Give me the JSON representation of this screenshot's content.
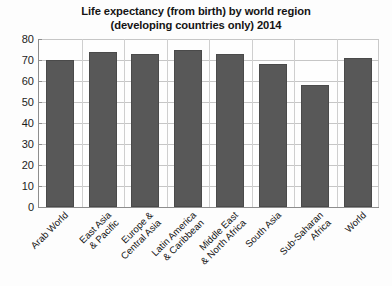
{
  "chart_data": {
    "type": "bar",
    "title": "Life expectancy (from birth) by world region\n(developing countries only) 2014",
    "title_line1": "Life expectancy (from birth) by world region",
    "title_line2": "(developing countries only) 2014",
    "xlabel": "",
    "ylabel": "",
    "ylim": [
      0,
      80
    ],
    "ytick_step": 10,
    "yticks": [
      80,
      70,
      60,
      50,
      40,
      30,
      20,
      10,
      0
    ],
    "grid": "horizontal-and-vertical",
    "legend": "none",
    "bar_color": "#585858",
    "categories": [
      "Arab World",
      "East Asia\n& Pacific",
      "Europe &\nCentral Asia",
      "Latin America\n& Caribbean",
      "Middle East\n& North Africa",
      "South Asia",
      "Sub-Saharan\nAfrica",
      "World"
    ],
    "values": [
      70,
      74,
      73,
      75,
      73,
      68,
      58,
      71
    ]
  }
}
